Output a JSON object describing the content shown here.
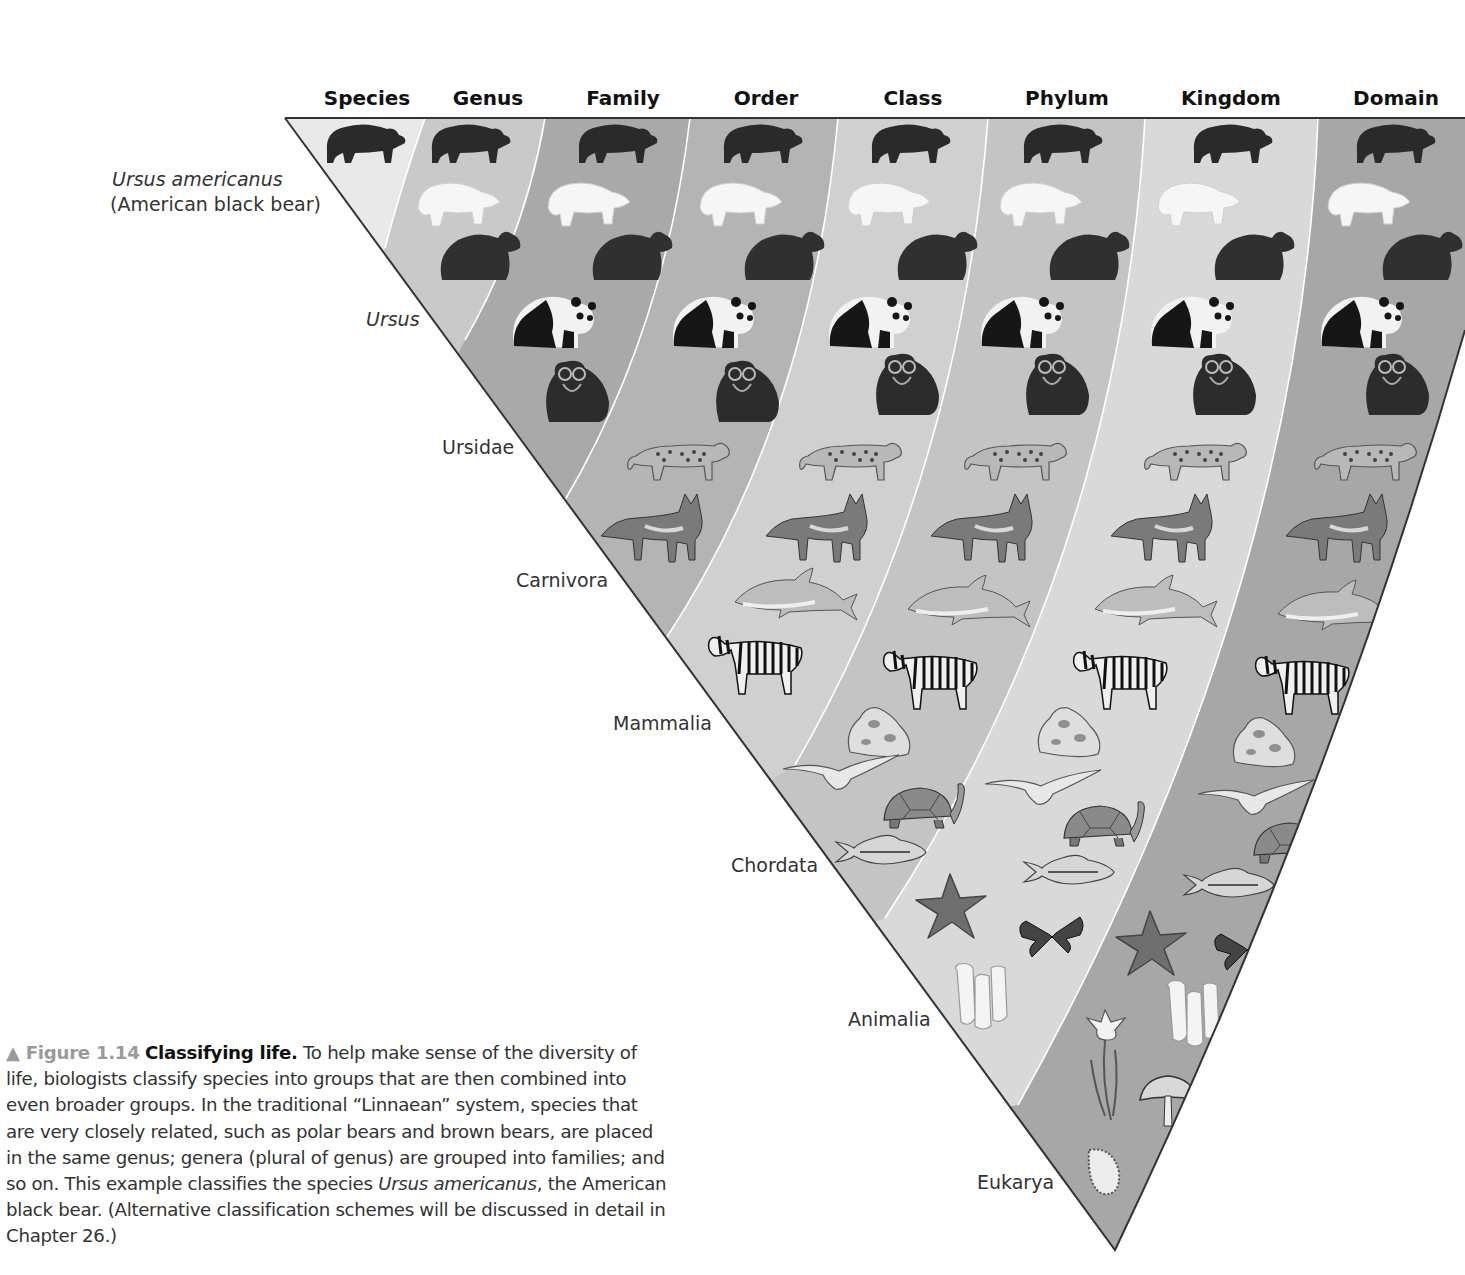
{
  "columns": [
    {
      "label": "Species",
      "x": 367
    },
    {
      "label": "Genus",
      "x": 488
    },
    {
      "label": "Family",
      "x": 623
    },
    {
      "label": "Order",
      "x": 766
    },
    {
      "label": "Class",
      "x": 913
    },
    {
      "label": "Phylum",
      "x": 1067
    },
    {
      "label": "Kingdom",
      "x": 1231
    },
    {
      "label": "Domain",
      "x": 1396
    }
  ],
  "rank_labels": {
    "species_name": "Ursus americanus",
    "species_common": "(American black bear)",
    "genus": "Ursus",
    "family": "Ursidae",
    "order": "Carnivora",
    "class": "Mammalia",
    "phylum": "Chordata",
    "kingdom": "Animalia",
    "domain": "Eukarya"
  },
  "organisms": [
    {
      "name": "American black bear",
      "icon": "black-bear-icon"
    },
    {
      "name": "Polar bear",
      "icon": "polar-bear-icon"
    },
    {
      "name": "Brown bear",
      "icon": "brown-bear-icon"
    },
    {
      "name": "Giant panda",
      "icon": "panda-icon"
    },
    {
      "name": "Spectacled bear",
      "icon": "spectacled-bear-icon"
    },
    {
      "name": "Leopard",
      "icon": "leopard-icon"
    },
    {
      "name": "Wolf",
      "icon": "wolf-icon"
    },
    {
      "name": "Dolphin",
      "icon": "dolphin-icon"
    },
    {
      "name": "Zebra",
      "icon": "zebra-icon"
    },
    {
      "name": "Frog",
      "icon": "frog-icon"
    },
    {
      "name": "Seagull",
      "icon": "bird-icon"
    },
    {
      "name": "Tortoise",
      "icon": "tortoise-icon"
    },
    {
      "name": "Fish",
      "icon": "fish-icon"
    },
    {
      "name": "Sea star",
      "icon": "starfish-icon"
    },
    {
      "name": "Butterfly",
      "icon": "butterfly-icon"
    },
    {
      "name": "Sponge",
      "icon": "sponge-icon"
    },
    {
      "name": "Flower (plant)",
      "icon": "flower-icon"
    },
    {
      "name": "Mushroom (fungus)",
      "icon": "mushroom-icon"
    },
    {
      "name": "Protist",
      "icon": "protist-icon"
    }
  ],
  "band_colors": {
    "species": "#e9e9e9",
    "genus": "#c9c9c9",
    "family": "#a9a9a9",
    "order": "#b4b4b4",
    "class": "#d0d0d0",
    "phylum": "#c4c4c4",
    "kingdom": "#d9d9d9",
    "domain": "#a7a7a7"
  },
  "caption": {
    "figure_label": "▲ Figure 1.14",
    "title": "Classifying life.",
    "text_1": " To help make sense of the diversity of life, biologists classify species into groups that are then combined into even broader groups. In the traditional “Linnaean” system, species that are very closely related, such as polar bears and brown bears, are placed in the same genus; genera (plural of genus) are grouped into families; and so on. This example classifies the species ",
    "italic": "Ursus americanus",
    "text_2": ", the American black bear. (Alternative classification schemes will be discussed in detail in Chapter 26.)"
  }
}
